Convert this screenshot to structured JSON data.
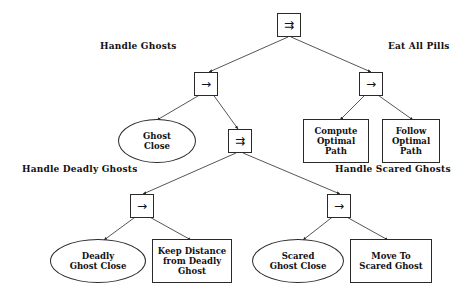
{
  "diagram": {
    "background": "#ffffff",
    "stroke": "#2a2a2a",
    "text_color": "#111111",
    "glyphs": {
      "parallel": "⇉",
      "sequence": "→"
    }
  },
  "nodes": {
    "root_parallel": {
      "symbol": "⇉",
      "type": "parallel"
    },
    "left_sequence": {
      "symbol": "→",
      "type": "sequence"
    },
    "right_sequence": {
      "symbol": "→",
      "type": "sequence"
    },
    "mid_parallel": {
      "symbol": "⇉",
      "type": "parallel"
    },
    "deadly_sequence": {
      "symbol": "→",
      "type": "sequence"
    },
    "scared_sequence": {
      "symbol": "→",
      "type": "sequence"
    },
    "ghost_close": {
      "line1": "Ghost",
      "line2": "Close",
      "type": "condition"
    },
    "compute_optimal_path": {
      "line1": "Compute",
      "line2": "Optimal",
      "line3": "Path",
      "type": "action"
    },
    "follow_optimal_path": {
      "line1": "Follow",
      "line2": "Optimal",
      "line3": "Path",
      "type": "action"
    },
    "deadly_ghost_close": {
      "line1": "Deadly",
      "line2": "Ghost Close",
      "type": "condition"
    },
    "keep_distance": {
      "line1": "Keep Distance",
      "line2": "from Deadly",
      "line3": "Ghost",
      "type": "action"
    },
    "scared_ghost_close": {
      "line1": "Scared",
      "line2": "Ghost Close",
      "type": "condition"
    },
    "move_to_scared_ghost": {
      "line1": "Move To",
      "line2": "Scared Ghost",
      "type": "action"
    }
  },
  "annotations": {
    "handle_ghosts": "Handle Ghosts",
    "eat_all_pills": "Eat All Pills",
    "handle_deadly_ghosts": "Handle Deadly Ghosts",
    "handle_scared_ghosts": "Handle Scared Ghosts"
  }
}
